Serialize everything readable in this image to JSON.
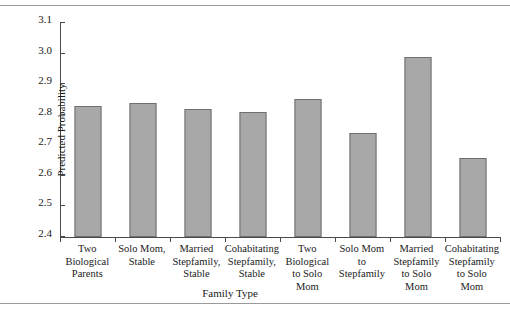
{
  "chart_data": {
    "type": "bar",
    "title": "",
    "xlabel": "Family Type",
    "ylabel": "Predicted Probability",
    "ylim": [
      2.4,
      3.1
    ],
    "yticks": [
      "2.4",
      "2.5",
      "2.6",
      "2.7",
      "2.8",
      "2.9",
      "3.0",
      "3.1"
    ],
    "ytick_values": [
      2.4,
      2.5,
      2.6,
      2.7,
      2.8,
      2.9,
      3.0,
      3.1
    ],
    "grid": false,
    "legend": "none",
    "bar_color": "#a8a8a8",
    "bar_border_color": "#6f6f6f",
    "categories": [
      "Two Biological Parents",
      "Solo Mom, Stable",
      "Married Stepfamily, Stable",
      "Cohabitating Stepfamily, Stable",
      "Two Biological to Solo Mom",
      "Solo Mom to Stepfamily",
      "Married Stepfamily to Solo Mom",
      "Cohabitating Stepfamily to Solo Mom"
    ],
    "values": [
      2.83,
      2.84,
      2.82,
      2.81,
      2.85,
      2.74,
      2.99,
      2.66
    ]
  }
}
